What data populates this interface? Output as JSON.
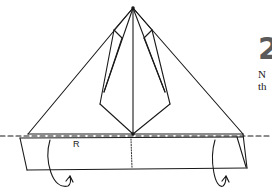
{
  "step": {
    "number": "2",
    "text_line1": "N",
    "text_line2": "th"
  },
  "labels": {
    "edge_label": "R"
  },
  "colors": {
    "line": "#1a1a1a",
    "step_number": "#5a5a5a",
    "background": "#ffffff"
  }
}
